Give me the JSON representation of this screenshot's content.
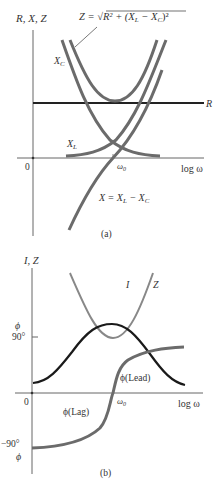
{
  "panel_a": {
    "y_axis_label": "R, X, Z",
    "z_formula": "Z = √R² + (XL − XC)²",
    "z_formula_parts": {
      "lhs": "Z = ",
      "sqrt": "√",
      "body": "R² + (X",
      "sub_l": "L",
      "mid": " − X",
      "sub_c": "C",
      "tail": ")²"
    },
    "xc_label": "X",
    "xc_sub": "C",
    "xl_label": "X",
    "xl_sub": "L",
    "r_label": "R",
    "origin_label": "0",
    "omega0_label": "ω",
    "omega0_sub": "0",
    "x_axis_label": "log ω",
    "x_eq_label": "X = X",
    "x_eq_sub_l": "L",
    "x_eq_mid": " − X",
    "x_eq_sub_c": "C",
    "caption": "(a)"
  },
  "panel_b": {
    "y_axis_label": "I, Z",
    "phi_top_label": "ϕ",
    "deg90_label": "90°",
    "i_label": "I",
    "z_label": "Z",
    "lead_label": "ϕ(Lead)",
    "lag_label": "ϕ(Lag)",
    "origin_label": "0",
    "omega0_label": "ω",
    "omega0_sub": "0",
    "x_axis_label": "log ω",
    "neg90_label": "−90°",
    "phi_bottom_label": "ϕ",
    "caption": "(b)"
  },
  "colors": {
    "axis": "#555555",
    "r_line": "#222222",
    "curve_gray": "#6b6b6b",
    "i_curve": "#1a1a1a",
    "z_curve_b": "#888888",
    "phi_curve": "#6b6b6b"
  }
}
